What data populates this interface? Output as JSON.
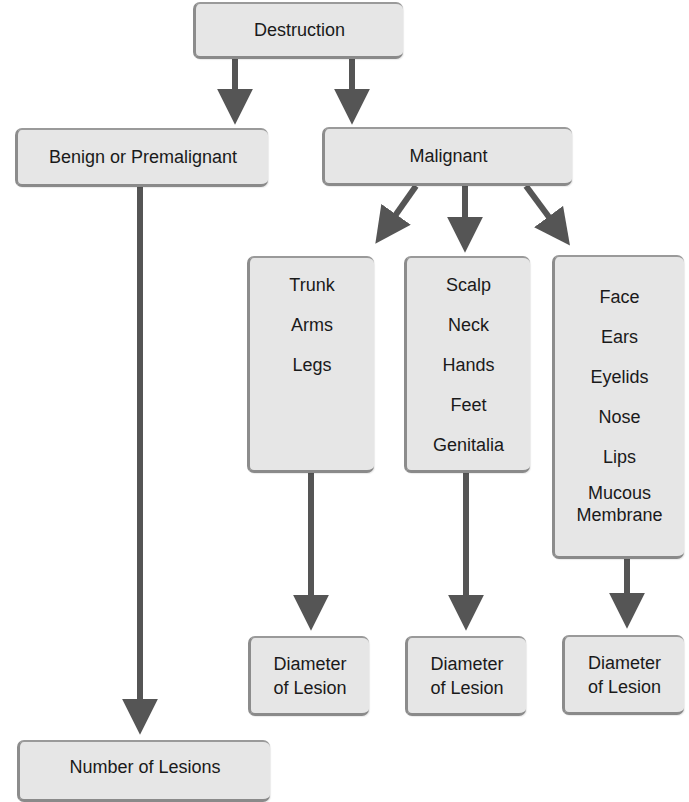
{
  "diagram": {
    "root": {
      "label": "Destruction"
    },
    "branches": {
      "benign": {
        "label": "Benign or Premalignant",
        "outcome": "Number of Lesions"
      },
      "malignant": {
        "label": "Malignant"
      }
    },
    "malignant_groups": [
      {
        "items": [
          "Trunk",
          "Arms",
          "Legs"
        ],
        "outcome": "Diameter\nof Lesion"
      },
      {
        "items": [
          "Scalp",
          "Neck",
          "Hands",
          "Feet",
          "Genitalia"
        ],
        "outcome": "Diameter\nof Lesion"
      },
      {
        "items": [
          "Face",
          "Ears",
          "Eyelids",
          "Nose",
          "Lips",
          "Mucous\nMembrane"
        ],
        "outcome": "Diameter\nof Lesion"
      }
    ],
    "colors": {
      "box_fill": "#e6e6e6",
      "box_edge": "#8c8c8c",
      "arrow": "#555555",
      "text": "#1a1a1a"
    }
  }
}
